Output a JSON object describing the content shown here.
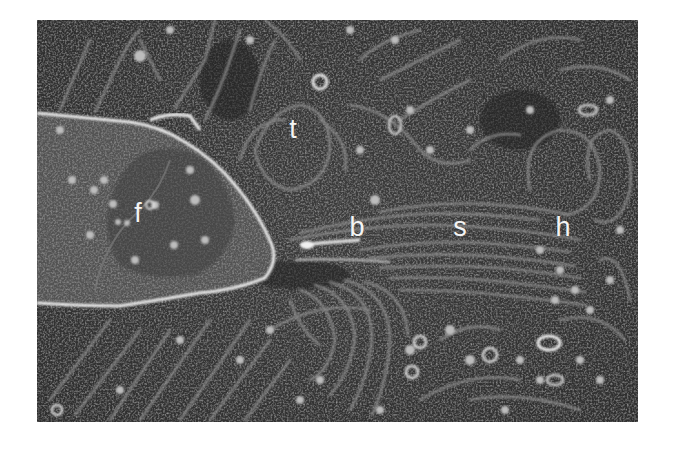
{
  "figure": {
    "type": "freeze-fracture electron micrograph (grayscale)",
    "labels": [
      {
        "id": "t",
        "text": "t",
        "x": 293,
        "y": 138
      },
      {
        "id": "f",
        "text": "f",
        "x": 138,
        "y": 222
      },
      {
        "id": "b",
        "text": "b",
        "x": 357,
        "y": 236
      },
      {
        "id": "s",
        "text": "s",
        "x": 460,
        "y": 236
      },
      {
        "id": "h",
        "text": "h",
        "x": 563,
        "y": 236
      }
    ],
    "colors": {
      "background": "#3a3a3a",
      "dark_region": "#262626",
      "membrane": "#9a9a9a",
      "bright_outline": "#f0f0f0",
      "label": "#f4f4f4",
      "page": "#ffffff"
    }
  }
}
